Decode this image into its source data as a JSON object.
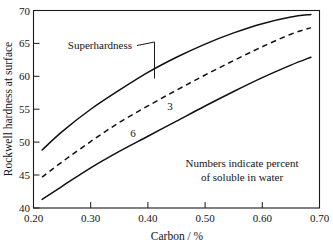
{
  "chart_data": {
    "type": "line",
    "title": "",
    "xlabel": "Carbon / %",
    "ylabel": "Rockwell hardness at surface",
    "xlim": [
      0.2,
      0.7
    ],
    "ylim": [
      40,
      70
    ],
    "xticks": [
      "0.20",
      "0.30",
      "0.40",
      "0.50",
      "0.60",
      "0.70"
    ],
    "xtick_values": [
      0.2,
      0.3,
      0.4,
      0.5,
      0.6,
      0.7
    ],
    "yticks": [
      "40",
      "45",
      "50",
      "55",
      "60",
      "65",
      "70"
    ],
    "ytick_values": [
      40,
      45,
      50,
      55,
      60,
      65,
      70
    ],
    "grid": false,
    "legend_position": "inline-annotations",
    "series": [
      {
        "name": "Superhardness",
        "label": "Superhardness",
        "style": "solid",
        "x": [
          0.215,
          0.25,
          0.3,
          0.35,
          0.4,
          0.45,
          0.5,
          0.55,
          0.6,
          0.65,
          0.685
        ],
        "values": [
          48.8,
          51.6,
          55.0,
          57.9,
          60.6,
          62.9,
          64.9,
          66.6,
          68.0,
          69.0,
          69.4
        ]
      },
      {
        "name": "3",
        "label": "3",
        "style": "dashed",
        "x": [
          0.215,
          0.25,
          0.3,
          0.35,
          0.4,
          0.45,
          0.5,
          0.55,
          0.6,
          0.65,
          0.685
        ],
        "values": [
          44.7,
          47.0,
          50.1,
          53.0,
          55.5,
          57.9,
          60.2,
          62.4,
          64.5,
          66.4,
          67.4
        ]
      },
      {
        "name": "6",
        "label": "6",
        "style": "solid",
        "x": [
          0.215,
          0.25,
          0.3,
          0.35,
          0.4,
          0.45,
          0.5,
          0.55,
          0.6,
          0.65,
          0.685
        ],
        "values": [
          41.3,
          43.3,
          46.1,
          48.6,
          50.9,
          53.2,
          55.5,
          57.7,
          59.8,
          61.7,
          62.9
        ]
      }
    ],
    "annotations": [
      {
        "name": "superhardness-callout",
        "text": "Superhardness"
      },
      {
        "name": "curve-label-3",
        "text": "3"
      },
      {
        "name": "curve-label-6",
        "text": "6"
      },
      {
        "name": "note-line-1",
        "text": "Numbers indicate percent"
      },
      {
        "name": "note-line-2",
        "text": "of soluble in water"
      }
    ],
    "colors": {
      "axis": "#1a1a1a",
      "curve": "#101010",
      "background": "#ffffff",
      "text": "#141414"
    }
  }
}
